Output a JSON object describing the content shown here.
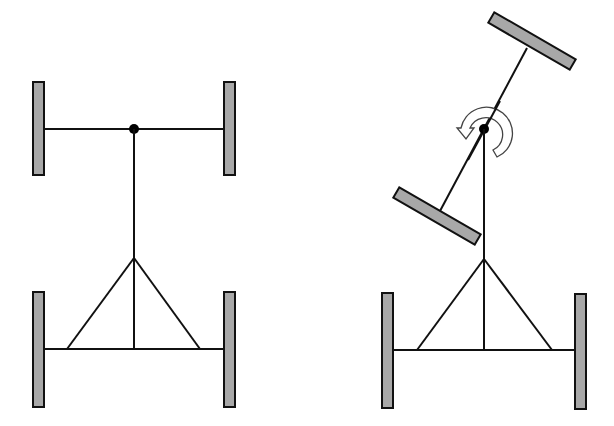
{
  "diagram": {
    "title": "",
    "colors": {
      "wheel_fill": "#a8a8a8",
      "line": "#111111",
      "pivot": "#000000",
      "background": "#ffffff"
    },
    "panels": [
      {
        "id": "straight",
        "state": "front axle straight",
        "pivot_icon": "pivot-dot"
      },
      {
        "id": "turned",
        "state": "front axle rotated about pivot",
        "pivot_icon": "rotation-arrow-icon"
      }
    ]
  }
}
